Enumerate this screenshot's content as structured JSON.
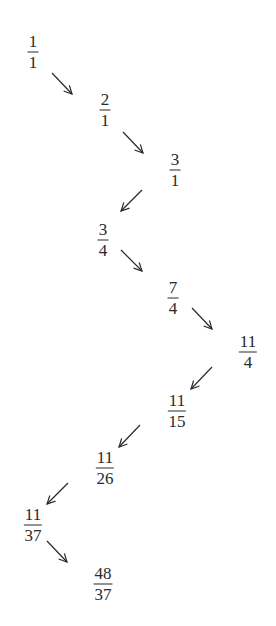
{
  "diagram": {
    "title": "",
    "type": "sequence-of-fractions",
    "nodes": [
      {
        "id": "n1",
        "numerator": "1",
        "denominator": "1",
        "x": 33,
        "y": 52
      },
      {
        "id": "n2",
        "numerator": "2",
        "denominator": "1",
        "x": 105,
        "y": 110
      },
      {
        "id": "n3",
        "numerator": "3",
        "denominator": "1",
        "x": 175,
        "y": 170
      },
      {
        "id": "n4",
        "numerator": "3",
        "denominator": "4",
        "x": 103,
        "y": 240
      },
      {
        "id": "n5",
        "numerator": "7",
        "denominator": "4",
        "x": 173,
        "y": 298
      },
      {
        "id": "n6",
        "numerator": "11",
        "denominator": "4",
        "x": 248,
        "y": 352
      },
      {
        "id": "n7",
        "numerator": "11",
        "denominator": "15",
        "x": 177,
        "y": 411
      },
      {
        "id": "n8",
        "numerator": "11",
        "denominator": "26",
        "x": 105,
        "y": 468
      },
      {
        "id": "n9",
        "numerator": "11",
        "denominator": "37",
        "x": 33,
        "y": 525
      },
      {
        "id": "n10",
        "numerator": "48",
        "denominator": "37",
        "x": 103,
        "y": 584
      }
    ],
    "edges": [
      {
        "from": "n1",
        "to": "n2",
        "direction": "down-right",
        "x1": 52,
        "y1": 73,
        "x2": 72,
        "y2": 94
      },
      {
        "from": "n2",
        "to": "n3",
        "direction": "down-right",
        "x1": 123,
        "y1": 132,
        "x2": 143,
        "y2": 153
      },
      {
        "from": "n3",
        "to": "n4",
        "direction": "down-left",
        "x1": 142,
        "y1": 190,
        "x2": 121,
        "y2": 211
      },
      {
        "from": "n4",
        "to": "n5",
        "direction": "down-right",
        "x1": 121,
        "y1": 250,
        "x2": 142,
        "y2": 271
      },
      {
        "from": "n5",
        "to": "n6",
        "direction": "down-right",
        "x1": 192,
        "y1": 308,
        "x2": 212,
        "y2": 329
      },
      {
        "from": "n6",
        "to": "n7",
        "direction": "down-left",
        "x1": 212,
        "y1": 367,
        "x2": 191,
        "y2": 389
      },
      {
        "from": "n7",
        "to": "n8",
        "direction": "down-left",
        "x1": 140,
        "y1": 425,
        "x2": 119,
        "y2": 447
      },
      {
        "from": "n8",
        "to": "n9",
        "direction": "down-left",
        "x1": 68,
        "y1": 483,
        "x2": 47,
        "y2": 504
      },
      {
        "from": "n9",
        "to": "n10",
        "direction": "down-right",
        "x1": 47,
        "y1": 541,
        "x2": 67,
        "y2": 562
      }
    ],
    "colors": {
      "ink": "#2a2a2a",
      "background": "#ffffff"
    }
  }
}
